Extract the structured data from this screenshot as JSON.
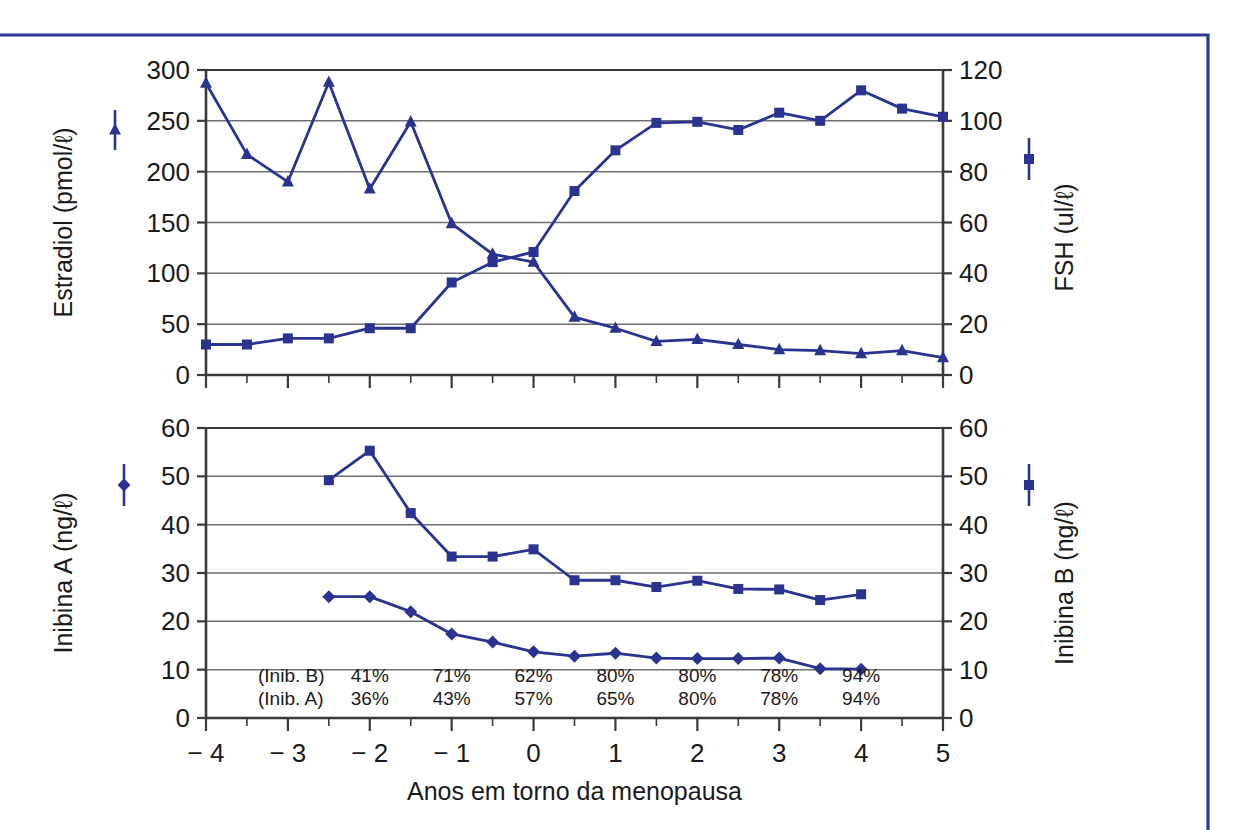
{
  "figure": {
    "border_color": "#2b3990",
    "series_color": "#2a3490",
    "axis_color": "#3a3a3a",
    "grid_color": "#6e6e6e",
    "background": "#ffffff"
  },
  "chart_data": [
    {
      "type": "line",
      "id": "top-panel",
      "title": "",
      "xlabel": "Anos em torno da menopausa",
      "ylabel": "Estradiol (pmol/ℓ)",
      "ylabel_right": "FSH (ul/ℓ)",
      "xlim": [
        -4,
        5
      ],
      "ylim": [
        0,
        300
      ],
      "ylim_right": [
        0,
        120
      ],
      "xticks": [
        -4,
        -3,
        -2,
        -1,
        0,
        1,
        2,
        3,
        4,
        5
      ],
      "xticklabels": [
        "− 4",
        "− 3",
        "− 2",
        "− 1",
        "0",
        "1",
        "2",
        "3",
        "4",
        "5"
      ],
      "yticks": [
        0,
        50,
        100,
        150,
        200,
        250,
        300
      ],
      "yticklabels": [
        "0",
        "50",
        "100",
        "150",
        "200",
        "250",
        "300"
      ],
      "yticks_right": [
        0,
        20,
        40,
        60,
        80,
        100,
        120
      ],
      "yticklabels_right": [
        "0",
        "20",
        "40",
        "60",
        "80",
        "100",
        "120"
      ],
      "grid": true,
      "legend_position": "outside-left-and-right",
      "series": [
        {
          "name": "Estradiol (pmol/ℓ)",
          "marker": "triangle",
          "axis": "left",
          "x": [
            -4,
            -3.5,
            -3,
            -2.5,
            -2,
            -1.5,
            -1,
            -0.5,
            0,
            0.5,
            1,
            1.5,
            2,
            2.5,
            3,
            3.5,
            4,
            4.5,
            5
          ],
          "values": [
            287,
            217,
            190,
            288,
            183,
            249,
            149,
            119,
            111,
            57,
            46,
            33,
            35,
            30,
            25,
            24,
            21,
            24,
            17
          ]
        },
        {
          "name": "FSH (ul/ℓ)",
          "marker": "square",
          "axis": "right",
          "x": [
            -4,
            -3.5,
            -3,
            -2.5,
            -2,
            -1.5,
            -1,
            -0.5,
            0,
            0.5,
            1,
            1.5,
            2,
            2.5,
            3,
            3.5,
            4,
            4.5,
            5
          ],
          "values": [
            12,
            12,
            14,
            14.5,
            18,
            18.5,
            36,
            44,
            48,
            72,
            88,
            99,
            100,
            100,
            98,
            102,
            106,
            100,
            112
          ],
          "values_left_scale": [
            30,
            30,
            36,
            36,
            46,
            46,
            91,
            111,
            121,
            181,
            221,
            248,
            249,
            241,
            258,
            250,
            280,
            262,
            254
          ]
        }
      ]
    },
    {
      "type": "line",
      "id": "bottom-panel",
      "title": "",
      "xlabel": "Anos em torno da menopausa",
      "ylabel": "Inibina A (ng/ℓ)",
      "ylabel_right": "Inibina B (ng/ℓ)",
      "xlim": [
        -4,
        5
      ],
      "ylim": [
        0,
        60
      ],
      "ylim_right": [
        0,
        60
      ],
      "xticks": [
        -4,
        -3,
        -2,
        -1,
        0,
        1,
        2,
        3,
        4,
        5
      ],
      "xticklabels": [
        "− 4",
        "− 3",
        "− 2",
        "− 1",
        "0",
        "1",
        "2",
        "3",
        "4",
        "5"
      ],
      "yticks": [
        0,
        10,
        20,
        30,
        40,
        50,
        60
      ],
      "yticklabels": [
        "0",
        "10",
        "20",
        "30",
        "40",
        "50",
        "60"
      ],
      "yticks_right": [
        0,
        10,
        20,
        30,
        40,
        50,
        60
      ],
      "yticklabels_right": [
        "0",
        "10",
        "20",
        "30",
        "40",
        "50",
        "60"
      ],
      "grid": true,
      "legend_position": "outside-left-and-right",
      "series": [
        {
          "name": "Inibina B (ng/ℓ)",
          "marker": "square",
          "axis": "right",
          "x": [
            -2.5,
            -2,
            -1.5,
            -1,
            -0.5,
            0,
            0.5,
            1,
            1.5,
            2,
            2.5,
            3,
            3.5,
            4
          ],
          "values": [
            49.2,
            55.3,
            42.4,
            33.4,
            33.4,
            34.9,
            28.5,
            28.5,
            27.1,
            28.4,
            26.7,
            26.6,
            24.4,
            25.6
          ]
        },
        {
          "name": "Inibina A (ng/ℓ)",
          "marker": "diamond",
          "axis": "left",
          "x": [
            -2.5,
            -2,
            -1.5,
            -1,
            -0.5,
            0,
            0.5,
            1,
            1.5,
            2,
            2.5,
            3,
            3.5,
            4
          ],
          "values": [
            25.1,
            25.1,
            22.0,
            17.4,
            15.7,
            13.7,
            12.8,
            13.4,
            12.4,
            12.3,
            12.3,
            12.4,
            10.2,
            10.1
          ]
        }
      ],
      "annotations": {
        "row_labels": [
          "(Inib. B)",
          "(Inib. A)"
        ],
        "x_positions": [
          -2,
          -1,
          0,
          1,
          2,
          3,
          4
        ],
        "rows": [
          [
            "41%",
            "71%",
            "62%",
            "80%",
            "80%",
            "78%",
            "94%"
          ],
          [
            "36%",
            "43%",
            "57%",
            "65%",
            "80%",
            "78%",
            "94%"
          ]
        ]
      }
    }
  ]
}
